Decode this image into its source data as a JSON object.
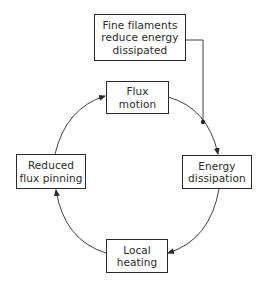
{
  "diagram": {
    "type": "cycle-flowchart",
    "colors": {
      "stroke": "#2a2a2a",
      "background": "#ffffff",
      "text": "#2a2a2a"
    },
    "external_node": {
      "id": "fine-filaments",
      "lines": [
        "Fine filaments",
        "reduce energy",
        "dissipated"
      ]
    },
    "nodes": [
      {
        "id": "flux-motion",
        "lines": [
          "Flux",
          "motion"
        ]
      },
      {
        "id": "energy-dissipation",
        "lines": [
          "Energy",
          "dissipation"
        ]
      },
      {
        "id": "local-heating",
        "lines": [
          "Local",
          "heating"
        ]
      },
      {
        "id": "reduced-flux-pinning",
        "lines": [
          "Reduced",
          "flux pinning"
        ]
      }
    ],
    "edges": [
      {
        "from": "flux-motion",
        "to": "energy-dissipation"
      },
      {
        "from": "energy-dissipation",
        "to": "local-heating"
      },
      {
        "from": "local-heating",
        "to": "reduced-flux-pinning"
      },
      {
        "from": "reduced-flux-pinning",
        "to": "flux-motion"
      },
      {
        "from": "fine-filaments",
        "to": "flux-motion->energy-dissipation",
        "style": "junction-dot"
      }
    ]
  }
}
